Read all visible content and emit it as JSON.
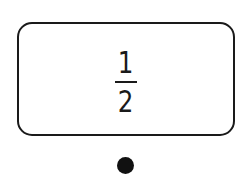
{
  "card": {
    "fraction": {
      "numerator": "1",
      "denominator": "2"
    }
  },
  "indicator": {
    "shape": "filled-circle",
    "color": "#111111"
  },
  "colors": {
    "stroke": "#1a1a1a",
    "background": "#ffffff"
  }
}
